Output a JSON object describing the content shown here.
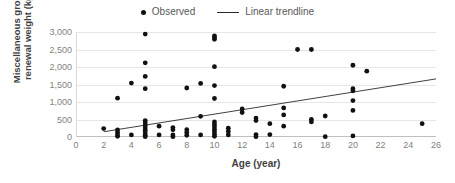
{
  "chart_data": {
    "type": "scatter",
    "title": "",
    "xlabel": "Age (year)",
    "ylabel": "Miscellaneous group renewal weight (kg)",
    "ylabel_line1": "Miscellaneous group",
    "ylabel_line2": "renewal weight (kg)",
    "xlim": [
      0,
      26
    ],
    "ylim": [
      0,
      3000
    ],
    "xticks": [
      0,
      2,
      4,
      6,
      8,
      10,
      12,
      14,
      16,
      18,
      20,
      22,
      24,
      26
    ],
    "xtick_labels": [
      "0",
      "2",
      "4",
      "6",
      "8",
      "10",
      "12",
      "14",
      "16",
      "18",
      "20",
      "22",
      "24",
      "26"
    ],
    "yticks": [
      0,
      500,
      1000,
      1500,
      2000,
      2500,
      3000
    ],
    "ytick_labels": [
      "0",
      "500",
      "1,000",
      "1,500",
      "2,000",
      "2,500",
      "3,000"
    ],
    "grid": "horizontal",
    "legend_position": "top-center",
    "legend": [
      {
        "label": "Observed",
        "marker": "dot",
        "color": "#111111"
      },
      {
        "label": "Linear trendline",
        "marker": "line",
        "color": "#2b2b2b"
      }
    ],
    "series": [
      {
        "name": "Observed",
        "marker": "dot",
        "color": "#111111",
        "points": [
          [
            2,
            240
          ],
          [
            3,
            1110
          ],
          [
            3,
            200
          ],
          [
            3,
            130
          ],
          [
            3,
            60
          ],
          [
            3,
            20
          ],
          [
            4,
            1540
          ],
          [
            4,
            60
          ],
          [
            5,
            2940
          ],
          [
            5,
            2120
          ],
          [
            5,
            1730
          ],
          [
            5,
            1380
          ],
          [
            5,
            470
          ],
          [
            5,
            400
          ],
          [
            5,
            330
          ],
          [
            5,
            260
          ],
          [
            5,
            190
          ],
          [
            5,
            120
          ],
          [
            5,
            50
          ],
          [
            5,
            10
          ],
          [
            6,
            310
          ],
          [
            6,
            60
          ],
          [
            7,
            270
          ],
          [
            7,
            210
          ],
          [
            7,
            60
          ],
          [
            7,
            10
          ],
          [
            8,
            1400
          ],
          [
            8,
            210
          ],
          [
            8,
            130
          ],
          [
            8,
            50
          ],
          [
            9,
            1530
          ],
          [
            9,
            590
          ],
          [
            9,
            60
          ],
          [
            10,
            2890
          ],
          [
            10,
            2840
          ],
          [
            10,
            2790
          ],
          [
            10,
            2010
          ],
          [
            10,
            1470
          ],
          [
            10,
            1100
          ],
          [
            10,
            430
          ],
          [
            10,
            360
          ],
          [
            10,
            290
          ],
          [
            10,
            220
          ],
          [
            10,
            150
          ],
          [
            10,
            80
          ],
          [
            10,
            20
          ],
          [
            11,
            250
          ],
          [
            11,
            160
          ],
          [
            11,
            60
          ],
          [
            12,
            800
          ],
          [
            12,
            700
          ],
          [
            13,
            540
          ],
          [
            13,
            470
          ],
          [
            13,
            70
          ],
          [
            13,
            10
          ],
          [
            14,
            380
          ],
          [
            14,
            70
          ],
          [
            15,
            1450
          ],
          [
            15,
            830
          ],
          [
            15,
            630
          ],
          [
            15,
            310
          ],
          [
            16,
            2500
          ],
          [
            17,
            2500
          ],
          [
            17,
            500
          ],
          [
            17,
            430
          ],
          [
            18,
            600
          ],
          [
            18,
            10
          ],
          [
            20,
            2050
          ],
          [
            20,
            1380
          ],
          [
            20,
            1320
          ],
          [
            20,
            1040
          ],
          [
            20,
            760
          ],
          [
            20,
            30
          ],
          [
            21,
            1880
          ],
          [
            25,
            380
          ]
        ]
      }
    ],
    "trendline": {
      "name": "Linear trendline",
      "color": "#2b2b2b",
      "x_start": 2,
      "y_start": 150,
      "x_end": 26,
      "y_end": 1660
    }
  }
}
